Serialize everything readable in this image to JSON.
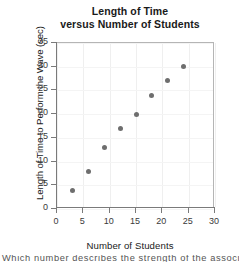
{
  "chart_data": {
    "type": "scatter",
    "title": "Length of Time versus Number of Students",
    "title_lines": [
      "Length of Time",
      "versus Number of Students"
    ],
    "xlabel": "Number of Students",
    "ylabel": "Length of Time to Perform the Wave (sec)",
    "xlim": [
      0,
      30
    ],
    "ylim": [
      0,
      35
    ],
    "xticks": [
      "0",
      "5",
      "10",
      "15",
      "20",
      "25",
      "30"
    ],
    "yticks": [
      "0",
      "5",
      "10",
      "15",
      "20",
      "25",
      "30",
      "35"
    ],
    "xtick_values": [
      0,
      5,
      10,
      15,
      20,
      25,
      30
    ],
    "ytick_values": [
      0,
      5,
      10,
      15,
      20,
      25,
      30,
      35
    ],
    "grid": true,
    "legend": null,
    "marker_color": "#6e6e6e",
    "axis_color": "#7a7a7a",
    "x": [
      3,
      6,
      9,
      12,
      15,
      18,
      21,
      24
    ],
    "y": [
      4,
      8,
      13,
      17,
      20,
      24,
      27,
      30
    ],
    "points": [
      {
        "x": 3,
        "y": 4
      },
      {
        "x": 6,
        "y": 8
      },
      {
        "x": 9,
        "y": 13
      },
      {
        "x": 12,
        "y": 17
      },
      {
        "x": 15,
        "y": 20
      },
      {
        "x": 18,
        "y": 24
      },
      {
        "x": 21,
        "y": 27
      },
      {
        "x": 24,
        "y": 30
      }
    ]
  },
  "caption": {
    "partial_text": "Which number describes the strength of the association"
  }
}
